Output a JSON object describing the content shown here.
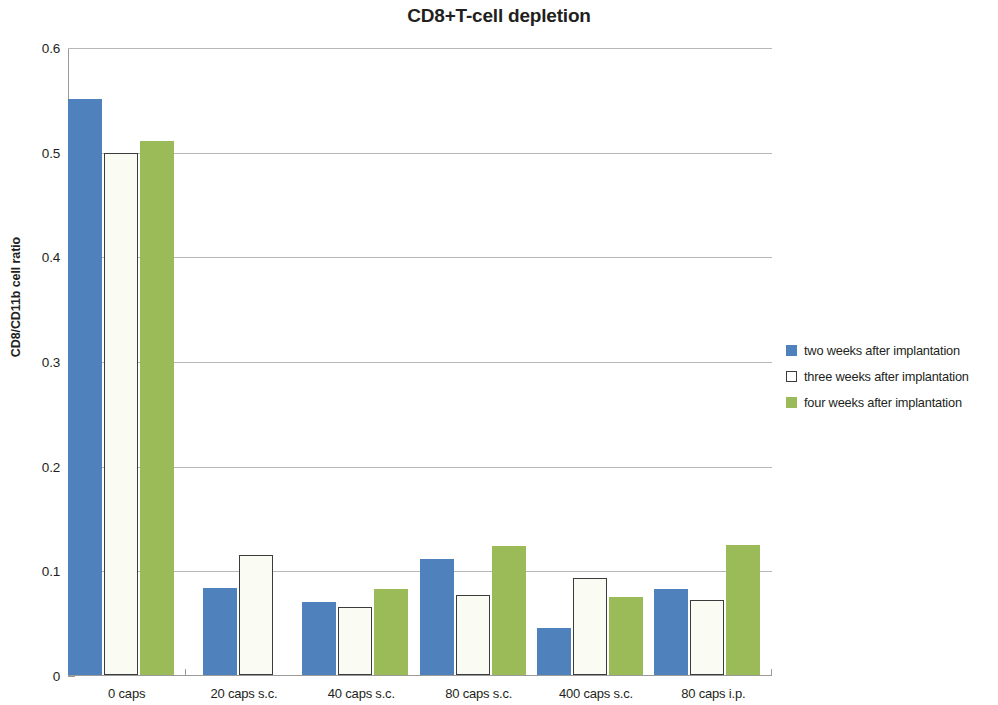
{
  "chart_data": {
    "type": "bar",
    "title": "CD8+T-cell depletion",
    "xlabel": "",
    "ylabel": "CD8/CD11b cell ratio",
    "ylim": [
      0,
      0.6
    ],
    "yticks": [
      "0",
      "0.1",
      "0.2",
      "0.3",
      "0.4",
      "0.5",
      "0.6"
    ],
    "ytick_values": [
      0,
      0.1,
      0.2,
      0.3,
      0.4,
      0.5,
      0.6
    ],
    "grid": "horizontal",
    "legend_position": "right",
    "categories": [
      "0 caps",
      "20 caps s.c.",
      "40 caps s.c.",
      "80 caps  s.c.",
      "400 caps s.c.",
      "80 caps i.p."
    ],
    "series": [
      {
        "name": "two weeks after implantation",
        "color": "#4F81BD",
        "values": [
          0.55,
          0.083,
          0.07,
          0.111,
          0.045,
          0.082
        ]
      },
      {
        "name": "three weeks after implantation",
        "color": "#FFFFFF",
        "values": [
          0.499,
          0.115,
          0.065,
          0.076,
          0.093,
          0.072
        ]
      },
      {
        "name": "four weeks after implantation",
        "color": "#9BBB59",
        "values": [
          0.51,
          null,
          0.082,
          0.123,
          0.075,
          0.124
        ]
      }
    ]
  }
}
